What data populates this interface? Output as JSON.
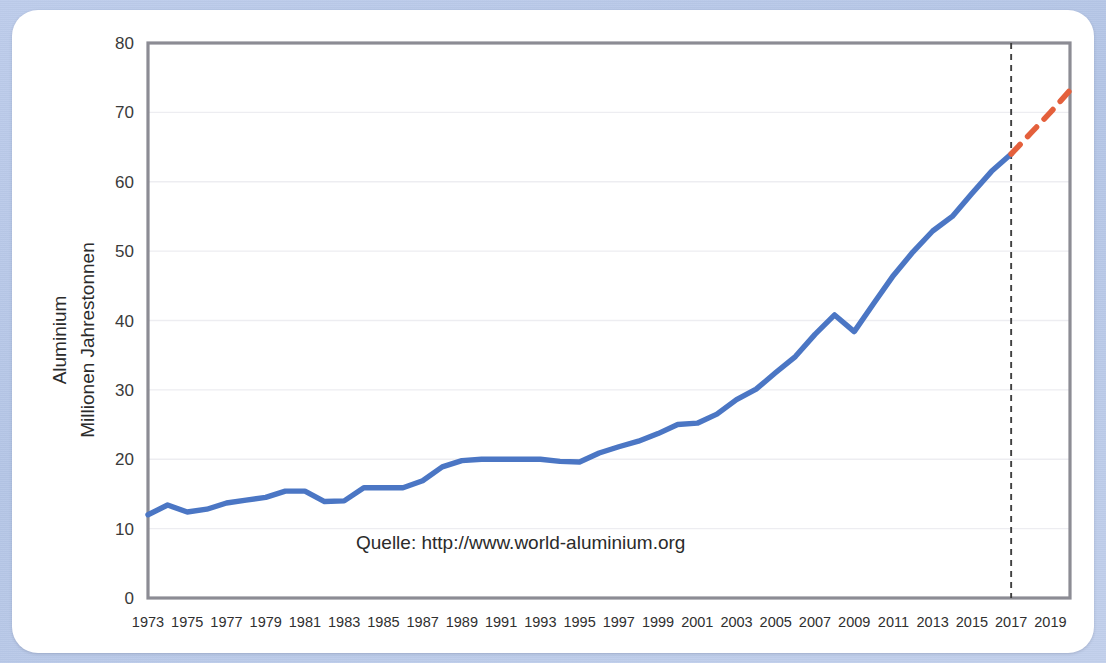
{
  "figure": {
    "background_color": "#b9c9e8",
    "card_color": "#ffffff",
    "source_note": "Quelle: http://www.world-aluminium.org"
  },
  "chart_data": {
    "type": "line",
    "title": "",
    "xlabel": "",
    "ylabel": "Aluminium\nMillionen Jahrestonnen",
    "ylabel_line1": "Aluminium",
    "ylabel_line2": "Millionen Jahrestonnen",
    "ylim": [
      0,
      80
    ],
    "yticks": [
      0,
      10,
      20,
      30,
      40,
      50,
      60,
      70,
      80
    ],
    "ytick_labels": [
      "0",
      "10",
      "20",
      "30",
      "40",
      "50",
      "60",
      "70",
      "80"
    ],
    "xlim": [
      1973,
      2020
    ],
    "xticks": [
      1973,
      1975,
      1977,
      1979,
      1981,
      1983,
      1985,
      1987,
      1989,
      1991,
      1993,
      1995,
      1997,
      1999,
      2001,
      2003,
      2005,
      2007,
      2009,
      2011,
      2013,
      2015,
      2017,
      2019
    ],
    "xtick_labels": [
      "1973",
      "1975",
      "1977",
      "1979",
      "1981",
      "1983",
      "1985",
      "1987",
      "1989",
      "1991",
      "1993",
      "1995",
      "1997",
      "1999",
      "2001",
      "2003",
      "2005",
      "2007",
      "2009",
      "2011",
      "2013",
      "2015",
      "2017",
      "2019"
    ],
    "grid": "horizontal",
    "legend": "none",
    "annotations": [
      {
        "type": "vline",
        "x": 2017,
        "style": "dashed",
        "color": "#404040",
        "label": ""
      },
      {
        "type": "text",
        "x": 1992,
        "y": 7,
        "text": "Quelle: http://www.world-aluminium.org"
      }
    ],
    "series": [
      {
        "name": "Aluminium Produktion (Ist)",
        "color": "#4b76c4",
        "style": "solid",
        "x": [
          1973,
          1974,
          1975,
          1976,
          1977,
          1978,
          1979,
          1980,
          1981,
          1982,
          1983,
          1984,
          1985,
          1986,
          1987,
          1988,
          1989,
          1990,
          1991,
          1992,
          1993,
          1994,
          1995,
          1996,
          1997,
          1998,
          1999,
          2000,
          2001,
          2002,
          2003,
          2004,
          2005,
          2006,
          2007,
          2008,
          2009,
          2010,
          2011,
          2012,
          2013,
          2014,
          2015,
          2016,
          2017
        ],
        "values": [
          12.0,
          13.4,
          12.4,
          12.8,
          13.7,
          14.1,
          14.5,
          15.4,
          15.4,
          13.9,
          14.0,
          15.9,
          15.9,
          15.9,
          16.9,
          18.9,
          19.8,
          20.0,
          20.0,
          20.0,
          20.0,
          19.7,
          19.6,
          20.9,
          21.8,
          22.6,
          23.7,
          25.0,
          25.2,
          26.5,
          28.6,
          30.1,
          32.5,
          34.8,
          38.0,
          40.8,
          38.4,
          42.5,
          46.5,
          49.9,
          52.9,
          55.0,
          58.3,
          61.5,
          64.0
        ]
      },
      {
        "name": "Aluminium Produktion (Prognose)",
        "color": "#e4603c",
        "style": "dashed",
        "x": [
          2017,
          2018,
          2019,
          2020
        ],
        "values": [
          64.0,
          67.0,
          70.0,
          73.2
        ]
      }
    ]
  }
}
